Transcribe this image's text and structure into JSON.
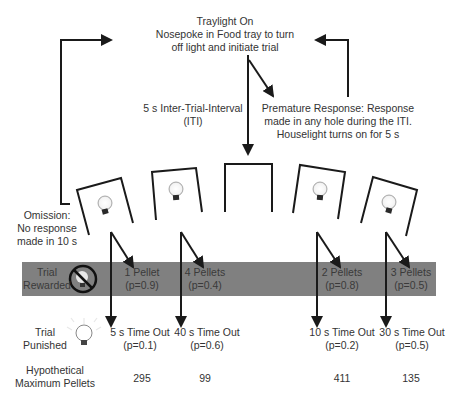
{
  "colors": {
    "band": "#808080",
    "line": "#1a1a1a",
    "text": "#333333"
  },
  "start": {
    "line1": "Traylight On",
    "line2": "Nosepoke in Food tray to turn",
    "line3": "off light and initiate trial"
  },
  "iti": {
    "line1": "5 s Inter-Trial-Interval",
    "line2": "(ITI)"
  },
  "premature": {
    "line1": "Premature Response: Response",
    "line2": "made in any hole during the ITI.",
    "line3": "Houselight turns on for 5 s"
  },
  "omission": {
    "line1": "Omission:",
    "line2": "No response",
    "line3": "made in 10 s"
  },
  "rows": {
    "rewarded": {
      "line1": "Trial",
      "line2": "Rewarded",
      "icon": "no-light-icon"
    },
    "punished": {
      "line1": "Trial",
      "line2": "Punished",
      "icon": "lightbulb-on-icon"
    },
    "max": {
      "line1": "Hypothetical",
      "line2": "Maximum Pellets"
    }
  },
  "options": [
    {
      "name": "P1",
      "reward": "1 Pellet",
      "reward_p": "(p=0.9)",
      "punish": "5 s Time Out",
      "punish_p": "(p=0.1)",
      "max": "295"
    },
    {
      "name": "P2",
      "reward": "4 Pellets",
      "reward_p": "(p=0.4)",
      "punish": "40 s Time Out",
      "punish_p": "(p=0.6)",
      "max": "99"
    },
    {
      "name": "P3",
      "reward": "2 Pellets",
      "reward_p": "(p=0.8)",
      "punish": "10 s Time Out",
      "punish_p": "(p=0.2)",
      "max": "411"
    },
    {
      "name": "P4",
      "reward": "3 Pellets",
      "reward_p": "(p=0.5)",
      "punish": "30 s Time Out",
      "punish_p": "(p=0.5)",
      "max": "135"
    }
  ]
}
